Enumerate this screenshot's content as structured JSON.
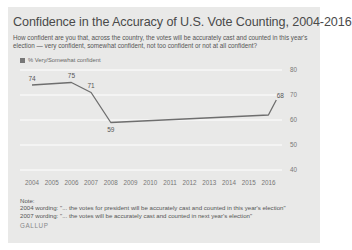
{
  "chart": {
    "title": "Confidence in the Accuracy of U.S. Vote Counting, 2004-2016",
    "subtitle": "How confident are you that, across the country, the votes will be accurately cast and counted in this year's election — very confident, somewhat confident, not too confident or not at all confident?",
    "legend_label": "% Very/Somewhat confident",
    "note_heading": "Note:",
    "note_2004": "2004 wording: \"... the votes for president will be accurately cast and counted in this year's election\"",
    "note_2007": "2007 wording: \"... the votes will be accurately cast and counted in next year's election\"",
    "source": "GALLUP",
    "colors": {
      "background": "#e9e9e8",
      "gridline": "#ffffff",
      "line": "#6e6e6e",
      "title": "#4a4a4a"
    }
  },
  "chart_data": {
    "type": "line",
    "title": "Confidence in the Accuracy of U.S. Vote Counting, 2004-2016",
    "xlabel": "",
    "ylabel": "% Very/Somewhat confident",
    "x_tick_labels": [
      "2004",
      "2005",
      "2006",
      "2007",
      "2008",
      "2009",
      "2010",
      "2011",
      "2012",
      "2013",
      "2014",
      "2015",
      "2016"
    ],
    "y_tick_labels": [
      "40",
      "50",
      "60",
      "70",
      "80"
    ],
    "ylim": [
      40,
      80
    ],
    "grid": true,
    "legend_position": "top-left",
    "series": [
      {
        "name": "% Very/Somewhat confident",
        "points": [
          {
            "x": 2004.0,
            "y": 74,
            "label": "74"
          },
          {
            "x": 2006.0,
            "y": 75,
            "label": "75"
          },
          {
            "x": 2007.0,
            "y": 71,
            "label": "71"
          },
          {
            "x": 2008.0,
            "y": 59,
            "label": "59"
          },
          {
            "x": 2016.0,
            "y": 62,
            "label": ""
          },
          {
            "x": 2016.4,
            "y": 68,
            "label": "68"
          }
        ]
      }
    ]
  }
}
